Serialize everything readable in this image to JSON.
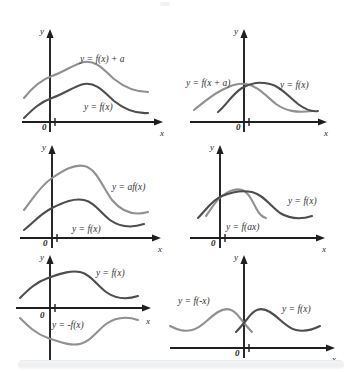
{
  "figure": {
    "background_color": "#ffffff",
    "curve_colors": {
      "dark": "#4d4d4d",
      "light": "#909090",
      "axis": "#1f1f1f"
    },
    "axis_labels": {
      "x": "x",
      "y": "y",
      "origin": "0"
    }
  },
  "panels": [
    {
      "id": "panel-vertical-shift",
      "name": "vertical-shift",
      "position": {
        "x": 18,
        "y": 24,
        "width": 158,
        "height": 116
      },
      "labels": [
        {
          "text": "y = f(x) + a",
          "x": 62,
          "y": 38,
          "color": "#333333"
        },
        {
          "text": "y = f(x)",
          "x": 66,
          "y": 86,
          "color": "#333333"
        }
      ],
      "curves": [
        {
          "name": "transformed-curve",
          "expression": "y = f(x) + a",
          "color": "#909090"
        },
        {
          "name": "base-curve",
          "expression": "y = f(x)",
          "color": "#4d4d4d"
        }
      ]
    },
    {
      "id": "panel-horizontal-shift",
      "name": "horizontal-shift",
      "position": {
        "x": 188,
        "y": 24,
        "width": 158,
        "height": 116
      },
      "labels": [
        {
          "text": "y = f(x + a)",
          "x": 2,
          "y": 62,
          "color": "#333333"
        },
        {
          "text": "y = f(x)",
          "x": 96,
          "y": 64,
          "color": "#333333"
        }
      ],
      "curves": [
        {
          "name": "transformed-curve",
          "expression": "y = f(x + a)",
          "color": "#909090"
        },
        {
          "name": "base-curve",
          "expression": "y = f(x)",
          "color": "#4d4d4d"
        }
      ]
    },
    {
      "id": "panel-vertical-stretch",
      "name": "vertical-stretch",
      "position": {
        "x": 18,
        "y": 140,
        "width": 158,
        "height": 112
      },
      "labels": [
        {
          "text": "y = af(x)",
          "x": 96,
          "y": 48,
          "color": "#333333"
        },
        {
          "text": "y = f(x)",
          "x": 56,
          "y": 88,
          "color": "#333333"
        }
      ],
      "curves": [
        {
          "name": "transformed-curve",
          "expression": "y = af(x)",
          "color": "#909090"
        },
        {
          "name": "base-curve",
          "expression": "y = f(x)",
          "color": "#4d4d4d"
        }
      ]
    },
    {
      "id": "panel-horizontal-stretch",
      "name": "horizontal-stretch",
      "position": {
        "x": 188,
        "y": 140,
        "width": 158,
        "height": 112
      },
      "labels": [
        {
          "text": "y = f(x)",
          "x": 102,
          "y": 62,
          "color": "#333333"
        },
        {
          "text": "y = f(ax)",
          "x": 40,
          "y": 86,
          "color": "#333333"
        }
      ],
      "curves": [
        {
          "name": "transformed-curve",
          "expression": "y = f(ax)",
          "color": "#909090"
        },
        {
          "name": "base-curve",
          "expression": "y = f(x)",
          "color": "#4d4d4d"
        }
      ]
    },
    {
      "id": "panel-reflect-x-axis",
      "name": "reflection-in-x-axis",
      "position": {
        "x": 14,
        "y": 252,
        "width": 158,
        "height": 112
      },
      "labels": [
        {
          "text": "y = f(x)",
          "x": 86,
          "y": 24,
          "color": "#333333"
        },
        {
          "text": "y = -f(x)",
          "x": 40,
          "y": 74,
          "color": "#333333"
        }
      ],
      "curves": [
        {
          "name": "base-curve",
          "expression": "y = f(x)",
          "color": "#4d4d4d"
        },
        {
          "name": "transformed-curve",
          "expression": "y = -f(x)",
          "color": "#909090"
        }
      ]
    },
    {
      "id": "panel-reflect-y-axis",
      "name": "reflection-in-y-axis",
      "position": {
        "x": 170,
        "y": 252,
        "width": 178,
        "height": 112
      },
      "labels": [
        {
          "text": "y = f(-x)",
          "x": 10,
          "y": 52,
          "color": "#333333"
        },
        {
          "text": "y = f(x)",
          "x": 116,
          "y": 60,
          "color": "#333333"
        }
      ],
      "curves": [
        {
          "name": "transformed-curve",
          "expression": "y = f(-x)",
          "color": "#909090"
        },
        {
          "name": "base-curve",
          "expression": "y = f(x)",
          "color": "#4d4d4d"
        }
      ]
    }
  ]
}
